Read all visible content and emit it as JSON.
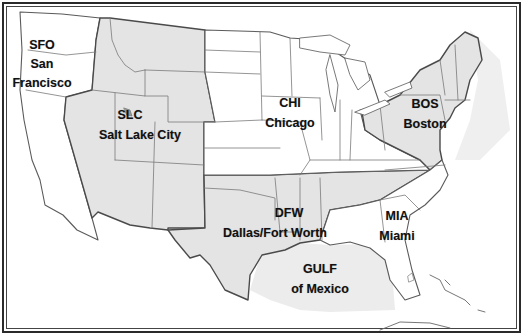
{
  "map": {
    "type": "region-map",
    "subject": "Continental United States with regional centers",
    "colors": {
      "shaded_region": "#e4e4e4",
      "unshaded_region": "#ffffff",
      "state_border": "#6a6a6a",
      "region_border": "#4a4a4a",
      "water_shade": "#ececec",
      "frame": "#2a2a2a",
      "label_text": "#111111"
    },
    "regions": [
      {
        "code": "SFO",
        "name": "San Francisco",
        "name_lines": [
          "San",
          "Francisco"
        ],
        "shaded": false
      },
      {
        "code": "SLC",
        "name": "Salt Lake City",
        "name_lines": [
          "Salt Lake City"
        ],
        "shaded": true
      },
      {
        "code": "CHI",
        "name": "Chicago",
        "name_lines": [
          "Chicago"
        ],
        "shaded": false
      },
      {
        "code": "BOS",
        "name": "Boston",
        "name_lines": [
          "Boston"
        ],
        "shaded": true
      },
      {
        "code": "DFW",
        "name": "Dallas/Fort Worth",
        "name_lines": [
          "Dallas/Fort Worth"
        ],
        "shaded": true
      },
      {
        "code": "MIA",
        "name": "Miami",
        "name_lines": [
          "Miami"
        ],
        "shaded": false
      },
      {
        "code": "GULF",
        "name": "of Mexico",
        "name_lines": [
          "of Mexico"
        ],
        "shaded": true
      }
    ]
  }
}
